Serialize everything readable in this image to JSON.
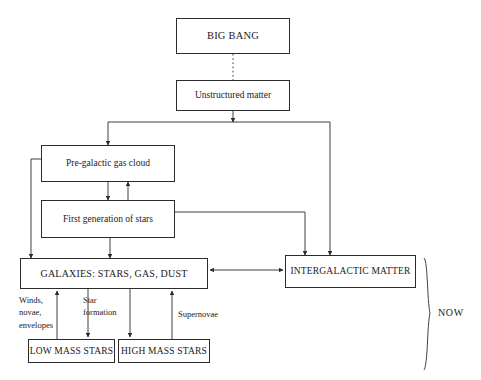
{
  "diagram": {
    "line_color": "#2b2b2b",
    "background": "#ffffff",
    "nodes": [
      {
        "id": "big-bang",
        "label": "BIG BANG",
        "x": 176,
        "y": 18,
        "w": 114,
        "h": 36,
        "font_size": 10.5,
        "style": "caps"
      },
      {
        "id": "unstructured",
        "label": "Unstructured matter",
        "x": 176,
        "y": 80,
        "w": 114,
        "h": 31,
        "font_size": 9.5,
        "style": "normal"
      },
      {
        "id": "pre-galactic",
        "label": "Pre-galactic gas cloud",
        "x": 41,
        "y": 145,
        "w": 134,
        "h": 37,
        "font_size": 9.5,
        "style": "normal"
      },
      {
        "id": "first-gen",
        "label": "First generation of stars",
        "x": 41,
        "y": 200,
        "w": 134,
        "h": 38,
        "font_size": 9.5,
        "style": "normal"
      },
      {
        "id": "galaxies",
        "label": "GALAXIES: STARS, GAS, DUST",
        "x": 20,
        "y": 258,
        "w": 188,
        "h": 31,
        "font_size": 10,
        "style": "caps"
      },
      {
        "id": "intergalactic",
        "label": "INTERGALACTIC MATTER",
        "x": 285,
        "y": 255,
        "w": 131,
        "h": 33,
        "font_size": 9.5,
        "style": "caps"
      },
      {
        "id": "low-mass",
        "label": "LOW MASS STARS",
        "x": 28,
        "y": 339,
        "w": 87,
        "h": 24,
        "font_size": 9.5,
        "style": "caps"
      },
      {
        "id": "high-mass",
        "label": "HIGH MASS STARS",
        "x": 118,
        "y": 339,
        "w": 92,
        "h": 24,
        "font_size": 9.5,
        "style": "caps"
      }
    ],
    "edge_labels": [
      {
        "id": "winds",
        "text": "Winds,\nnovae,\nenvelopes",
        "x": 19,
        "y": 294
      },
      {
        "id": "star-formation",
        "text": "Star\nformation",
        "x": 83,
        "y": 294
      },
      {
        "id": "supernovae",
        "text": "Supernovae",
        "x": 178,
        "y": 308
      }
    ],
    "annotations": [
      {
        "id": "now",
        "text": "NOW",
        "x": 438,
        "y": 307
      }
    ]
  }
}
